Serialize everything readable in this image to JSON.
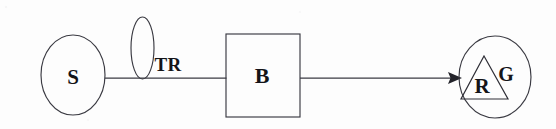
{
  "diagram": {
    "background_color": "#fdfdfd",
    "stroke_color": "#3a3a42",
    "text_color": "#141418",
    "nodes": [
      {
        "id": "source",
        "label": "S",
        "shape": "ellipse",
        "cx": 73,
        "cy": 75,
        "rx": 32,
        "ry": 40
      },
      {
        "id": "transducer",
        "label": "TR",
        "shape": "ellipse",
        "cx": 142.5,
        "cy": 48,
        "rx": 11.5,
        "ry": 31,
        "label_position": "right"
      },
      {
        "id": "block",
        "label": "B",
        "shape": "rectangle",
        "x": 226,
        "y": 34,
        "width": 74,
        "height": 83
      },
      {
        "id": "goal",
        "label": "G",
        "shape": "ellipse",
        "cx": 495,
        "cy": 77,
        "rx": 36,
        "ry": 41,
        "label_position": "inside-right"
      },
      {
        "id": "receiver",
        "label": "R",
        "shape": "triangle",
        "apex_x": 484,
        "apex_y": 56,
        "base_left_x": 461,
        "base_right_x": 508,
        "base_y": 99
      }
    ],
    "edges": [
      {
        "id": "edge-s-to-b",
        "from": "source",
        "to": "block",
        "x1": 105,
        "y1": 78,
        "x2": 226,
        "y2": 78,
        "arrow": false,
        "passes_through": "transducer"
      },
      {
        "id": "edge-b-to-g",
        "from": "block",
        "to": "goal",
        "x1": 300,
        "y1": 78,
        "x2": 462,
        "y2": 78,
        "arrow": true
      }
    ],
    "labels": {
      "s": "S",
      "tr": "TR",
      "b": "B",
      "r": "R",
      "g": "G"
    }
  }
}
